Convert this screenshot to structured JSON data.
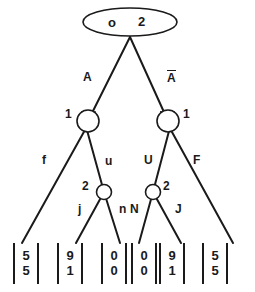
{
  "diagram": {
    "type": "binary-decision-tree",
    "root": {
      "shape": "ellipse",
      "labels": [
        "o",
        "2"
      ],
      "left_label": "o",
      "right_label": "2"
    },
    "level1": {
      "left_node": {
        "shape": "circle",
        "label": "1",
        "label_side": "left"
      },
      "right_node": {
        "shape": "circle",
        "label": "1",
        "label_side": "right"
      }
    },
    "level2": {
      "left_node": {
        "shape": "circle",
        "label": "2",
        "label_side": "left"
      },
      "right_node": {
        "shape": "circle",
        "label": "2",
        "label_side": "right"
      }
    },
    "edges": {
      "root_left": "A",
      "root_right": "A̅",
      "root_right_plain": "A",
      "l1_left_left": "f",
      "l1_left_right": "u",
      "l1_right_left": "U",
      "l1_right_right": "F",
      "l2_left_left": "j",
      "l2_left_right": "n",
      "l2_right_left": "N",
      "l2_right_right": "J"
    },
    "leaves": [
      {
        "id": "leaf-1",
        "top": "5",
        "bottom": "5"
      },
      {
        "id": "leaf-2",
        "top": "9",
        "bottom": "1"
      },
      {
        "id": "leaf-3",
        "top": "0",
        "bottom": "0"
      },
      {
        "id": "leaf-4",
        "top": "0",
        "bottom": "0"
      },
      {
        "id": "leaf-5",
        "top": "9",
        "bottom": "1"
      },
      {
        "id": "leaf-6",
        "top": "5",
        "bottom": "5"
      }
    ],
    "colors": {
      "ink": "#1a1a1a",
      "paper": "#ffffff"
    }
  }
}
